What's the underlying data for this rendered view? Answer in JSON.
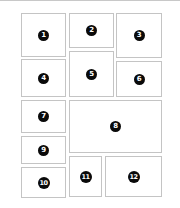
{
  "layout": {
    "description": "Page layout grid with 12 numbered panels",
    "border_color": "#c4c4c4",
    "badge_color": "#0a0a0a",
    "badge_text_color": "#ffffff"
  },
  "panels": [
    {
      "label": "1",
      "x": 21,
      "y": 13,
      "w": 45,
      "h": 44
    },
    {
      "label": "2",
      "x": 69,
      "y": 13,
      "w": 45,
      "h": 35
    },
    {
      "label": "3",
      "x": 116,
      "y": 13,
      "w": 46,
      "h": 45
    },
    {
      "label": "4",
      "x": 21,
      "y": 59,
      "w": 45,
      "h": 38
    },
    {
      "label": "5",
      "x": 69,
      "y": 51,
      "w": 45,
      "h": 46
    },
    {
      "label": "6",
      "x": 116,
      "y": 61,
      "w": 46,
      "h": 36
    },
    {
      "label": "7",
      "x": 21,
      "y": 100,
      "w": 45,
      "h": 33
    },
    {
      "label": "8",
      "x": 69,
      "y": 100,
      "w": 93,
      "h": 53
    },
    {
      "label": "9",
      "x": 21,
      "y": 136,
      "w": 45,
      "h": 28
    },
    {
      "label": "10",
      "x": 21,
      "y": 167,
      "w": 45,
      "h": 31
    },
    {
      "label": "11",
      "x": 69,
      "y": 156,
      "w": 33,
      "h": 41
    },
    {
      "label": "12",
      "x": 105,
      "y": 156,
      "w": 57,
      "h": 41
    }
  ]
}
